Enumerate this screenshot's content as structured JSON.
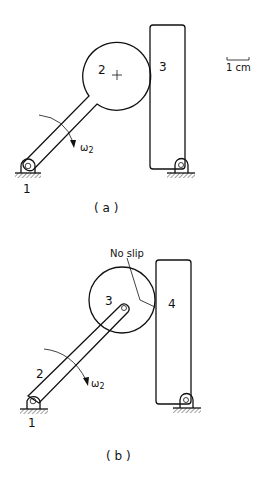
{
  "figure_a": {
    "caption": "( a )",
    "link_label": "2",
    "block_label": "3",
    "ground_label": "1",
    "omega_label": "ω",
    "omega_sub": "2",
    "scale_bar_label": "1 cm"
  },
  "figure_b": {
    "caption": "( b )",
    "link_label": "2",
    "disk_label": "3",
    "block_label": "4",
    "ground_label": "1",
    "omega_label": "ω",
    "omega_sub": "2",
    "annotation": "No slip"
  },
  "colors": {
    "line": "#111111",
    "background": "#ffffff"
  }
}
